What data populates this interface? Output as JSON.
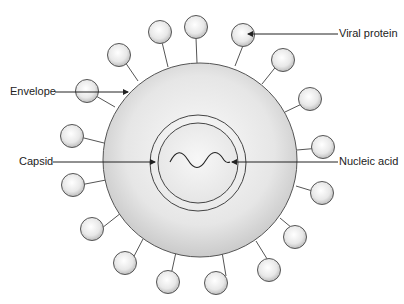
{
  "diagram": {
    "type": "virus-structure",
    "labels": {
      "viral_protein": "Viral protein",
      "envelope": "Envelope",
      "capsid": "Capsid",
      "nucleic_acid": "Nucleic acid"
    },
    "colors": {
      "outline": "#555555",
      "envelope_fill_center": "#f4f4f4",
      "envelope_fill_edge": "#c9c9c9",
      "text": "#222222"
    }
  }
}
